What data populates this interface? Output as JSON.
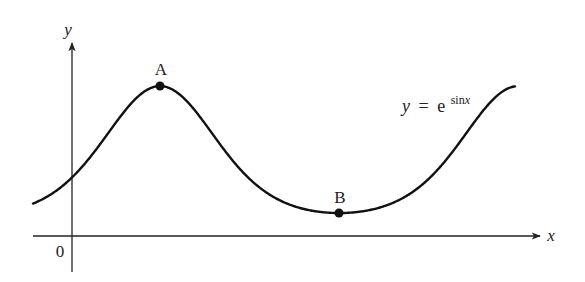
{
  "figure": {
    "function_label": {
      "lhs": "y",
      "equals": "=",
      "base": "e",
      "exponent": "sin",
      "exponent_var": "x"
    },
    "axes": {
      "x_label": "x",
      "y_label": "y",
      "origin_label": "0"
    },
    "points": [
      {
        "label": "A",
        "description": "maximum",
        "x": "π/2",
        "y": "e"
      },
      {
        "label": "B",
        "description": "minimum",
        "x": "3π/2",
        "y": "1/e"
      }
    ],
    "colors": {
      "curve": "#111111",
      "axes": "#222222",
      "background": "#ffffff"
    }
  },
  "chart_data": {
    "type": "line",
    "title": "",
    "function": "y = e^(sin x)",
    "xlabel": "x",
    "ylabel": "y",
    "x_range": [
      -0.67,
      7.8
    ],
    "series": [
      {
        "name": "y = e^sin x",
        "x": [
          -0.67,
          0,
          0.5,
          1.0,
          1.5708,
          2.0,
          2.5,
          3.0,
          3.1416,
          3.5,
          4.0,
          4.7124,
          5.0,
          5.5,
          6.0,
          6.2832,
          7.0,
          7.8
        ],
        "y": [
          0.54,
          1.0,
          1.61,
          2.32,
          2.718,
          2.48,
          1.82,
          1.15,
          1.0,
          0.7,
          0.47,
          0.368,
          0.38,
          0.5,
          0.76,
          1.0,
          1.93,
          2.7
        ]
      }
    ],
    "annotations": [
      {
        "label": "A",
        "x": 1.5708,
        "y": 2.718
      },
      {
        "label": "B",
        "x": 4.7124,
        "y": 0.368
      },
      {
        "label": "0",
        "at": "origin"
      }
    ],
    "grid": false,
    "legend": "none"
  }
}
